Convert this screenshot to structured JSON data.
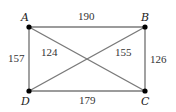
{
  "graph": {
    "title": "",
    "vertices": [
      {
        "id": "A",
        "label": "A",
        "x": 29,
        "y": 27
      },
      {
        "id": "B",
        "label": "B",
        "x": 145,
        "y": 27
      },
      {
        "id": "C",
        "label": "C",
        "x": 145,
        "y": 91
      },
      {
        "id": "D",
        "label": "D",
        "x": 29,
        "y": 91
      }
    ],
    "edges": [
      {
        "from": "A",
        "to": "B",
        "weight": "190"
      },
      {
        "from": "B",
        "to": "C",
        "weight": "126"
      },
      {
        "from": "D",
        "to": "C",
        "weight": "179"
      },
      {
        "from": "A",
        "to": "D",
        "weight": "157"
      },
      {
        "from": "A",
        "to": "C",
        "weight": "124"
      },
      {
        "from": "D",
        "to": "B",
        "weight": "155"
      }
    ],
    "colors": {
      "edge": "#7a7a7a",
      "vertex": "#000000",
      "label": "#222222"
    }
  }
}
